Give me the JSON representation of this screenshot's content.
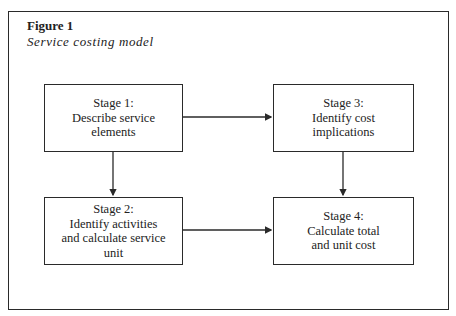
{
  "figure": {
    "label": "Figure 1",
    "title": "Service costing model"
  },
  "stages": [
    {
      "heading": "Stage 1:",
      "lines": [
        "Describe service",
        "elements"
      ]
    },
    {
      "heading": "Stage 2:",
      "lines": [
        "Identify activities",
        "and calculate service",
        "unit"
      ]
    },
    {
      "heading": "Stage 3:",
      "lines": [
        "Identify cost",
        "implications"
      ]
    },
    {
      "heading": "Stage 4:",
      "lines": [
        "Calculate total",
        "and unit cost"
      ]
    }
  ],
  "connections": [
    {
      "from": "Stage 1",
      "to": "Stage 3"
    },
    {
      "from": "Stage 1",
      "to": "Stage 2"
    },
    {
      "from": "Stage 3",
      "to": "Stage 4"
    },
    {
      "from": "Stage 2",
      "to": "Stage 4"
    }
  ],
  "colors": {
    "line": "#2a2a2a",
    "background": "#ffffff"
  }
}
